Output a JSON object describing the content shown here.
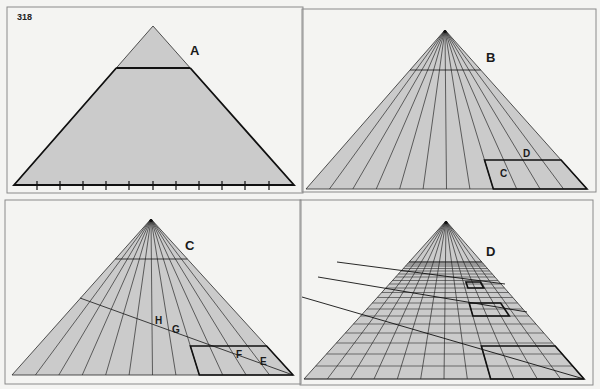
{
  "page_number": "318",
  "colors": {
    "background": "#f4f4f2",
    "frame": "#8a8a8a",
    "fill": "#cbcbcb",
    "line": "#2a2a2a",
    "bold": "#111111"
  },
  "panels": [
    {
      "id": "A",
      "label": "A",
      "label_pos": [
        190,
        55
      ],
      "frame": [
        7,
        7,
        296,
        186
      ],
      "apex": [
        153,
        26
      ],
      "base_left": [
        14,
        185
      ],
      "base_right": [
        294,
        185
      ],
      "horizon_y": 68,
      "rays": 0,
      "ticks": [
        37,
        60,
        83,
        106,
        129,
        153,
        176,
        199,
        222,
        245,
        269
      ],
      "bold_outline": true
    },
    {
      "id": "B",
      "label": "B",
      "label_pos": [
        486,
        62
      ],
      "frame": [
        302,
        9,
        294,
        183
      ],
      "apex": [
        445,
        30
      ],
      "base_left": [
        306,
        189
      ],
      "base_right": [
        587,
        189
      ],
      "horizon_y": 70,
      "rays": 12,
      "box": {
        "top_y": 160,
        "bottom_y": 189,
        "col_start": 8,
        "col_end": 12
      },
      "annotations": [
        {
          "text": "D",
          "pos": [
            523,
            157
          ]
        },
        {
          "text": "C",
          "pos": [
            500,
            177
          ]
        }
      ]
    },
    {
      "id": "C",
      "label": "C",
      "label_pos": [
        185,
        250
      ],
      "frame": [
        5,
        200,
        296,
        184
      ],
      "apex": [
        151,
        219
      ],
      "base_left": [
        12,
        375
      ],
      "base_right": [
        293,
        375
      ],
      "horizon_y": 259,
      "rays": 12,
      "diagonal": [
        [
          80,
          298
        ],
        [
          293,
          375
        ]
      ],
      "box": {
        "top_y": 346,
        "bottom_y": 375,
        "col_start": 8,
        "col_end": 12
      },
      "annotations": [
        {
          "text": "H",
          "pos": [
            155,
            324
          ]
        },
        {
          "text": "G",
          "pos": [
            172,
            333
          ]
        },
        {
          "text": "F",
          "pos": [
            236,
            358
          ]
        },
        {
          "text": "E",
          "pos": [
            260,
            365
          ]
        }
      ]
    },
    {
      "id": "D",
      "label": "D",
      "label_pos": [
        486,
        256
      ],
      "frame": [
        300,
        200,
        293,
        185
      ],
      "apex": [
        446,
        221
      ],
      "base_left": [
        304,
        379
      ],
      "base_right": [
        584,
        379
      ],
      "horizon_y": 262,
      "rays": 12,
      "grid_rows": [
        262,
        264,
        266,
        268.5,
        271,
        274,
        277,
        280.5,
        284,
        288,
        292.5,
        297.5,
        303,
        309,
        316,
        324,
        333,
        343,
        354,
        366,
        379
      ],
      "diagonals": [
        [
          [
            337,
            262
          ],
          [
            505,
            284
          ]
        ],
        [
          [
            318,
            277
          ],
          [
            527,
            312
          ]
        ],
        [
          [
            302,
            297
          ],
          [
            584,
            379
          ]
        ]
      ],
      "boxes": [
        {
          "top_y": 346,
          "bottom_y": 379,
          "col_start": 8,
          "col_end": 12
        },
        {
          "top_y": 303,
          "bottom_y": 316,
          "col_start": 8,
          "col_end": 10.6
        },
        {
          "top_y": 282,
          "bottom_y": 288,
          "col_start": 8.3,
          "col_end": 9.9
        }
      ]
    }
  ]
}
